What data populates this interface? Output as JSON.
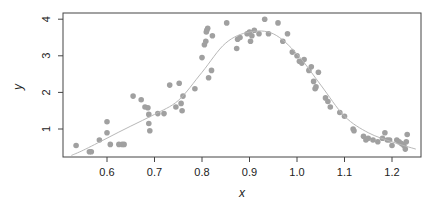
{
  "chart_data": {
    "type": "scatter",
    "title": "",
    "xlabel": "x",
    "ylabel": "y",
    "xlim": [
      0.52,
      1.26
    ],
    "ylim": [
      0.25,
      4.15
    ],
    "x_ticks": [
      0.6,
      0.7,
      0.8,
      0.9,
      1.0,
      1.1,
      1.2
    ],
    "x_tick_labels": [
      "0.6",
      "0.7",
      "0.8",
      "0.9",
      "1.0",
      "1.1",
      "1.2"
    ],
    "y_ticks": [
      1,
      2,
      3,
      4
    ],
    "y_tick_labels": [
      "1",
      "2",
      "3",
      "4"
    ],
    "grid": false,
    "legend": null,
    "point_color": "#a0a0a0",
    "curve_color": "#b8b8b8",
    "series": [
      {
        "name": "observations",
        "kind": "points",
        "x": [
          0.535,
          0.563,
          0.567,
          0.584,
          0.6,
          0.6,
          0.607,
          0.625,
          0.632,
          0.636,
          0.655,
          0.672,
          0.68,
          0.686,
          0.688,
          0.688,
          0.69,
          0.707,
          0.72,
          0.732,
          0.745,
          0.752,
          0.756,
          0.758,
          0.76,
          0.785,
          0.8,
          0.805,
          0.808,
          0.809,
          0.81,
          0.812,
          0.814,
          0.82,
          0.822,
          0.852,
          0.873,
          0.875,
          0.88,
          0.895,
          0.9,
          0.902,
          0.905,
          0.91,
          0.92,
          0.932,
          0.94,
          0.96,
          0.97,
          0.98,
          0.99,
          1.0,
          1.005,
          1.01,
          1.015,
          1.025,
          1.03,
          1.035,
          1.038,
          1.04,
          1.045,
          1.06,
          1.065,
          1.07,
          1.09,
          1.1,
          1.118,
          1.12,
          1.14,
          1.145,
          1.15,
          1.16,
          1.17,
          1.18,
          1.185,
          1.19,
          1.195,
          1.2,
          1.21,
          1.215,
          1.22,
          1.225,
          1.228,
          1.23,
          1.232
        ],
        "y": [
          0.55,
          0.38,
          0.38,
          0.7,
          0.9,
          1.2,
          0.58,
          0.58,
          0.58,
          0.58,
          1.9,
          1.8,
          1.6,
          1.58,
          1.4,
          1.15,
          0.95,
          1.42,
          1.42,
          2.2,
          1.6,
          2.25,
          1.7,
          1.5,
          1.9,
          2.1,
          2.95,
          3.3,
          3.4,
          3.65,
          3.7,
          3.75,
          2.4,
          2.6,
          3.55,
          3.9,
          3.2,
          3.45,
          3.5,
          3.6,
          3.65,
          3.4,
          3.55,
          3.7,
          3.6,
          4.0,
          3.6,
          3.9,
          3.4,
          3.6,
          3.1,
          3.0,
          2.85,
          2.8,
          2.9,
          2.6,
          2.7,
          2.3,
          2.1,
          2.15,
          2.55,
          1.85,
          1.75,
          1.6,
          1.45,
          1.35,
          1.0,
          0.95,
          0.8,
          0.7,
          0.75,
          0.7,
          0.65,
          0.75,
          0.9,
          0.7,
          0.7,
          0.55,
          0.7,
          0.65,
          0.6,
          0.55,
          0.45,
          0.65,
          0.85
        ]
      },
      {
        "name": "smooth fit",
        "kind": "line",
        "x": [
          0.525,
          0.55,
          0.6,
          0.65,
          0.7,
          0.75,
          0.8,
          0.85,
          0.9,
          0.95,
          1.0,
          1.05,
          1.1,
          1.15,
          1.2,
          1.25
        ],
        "y": [
          0.28,
          0.42,
          0.75,
          1.08,
          1.4,
          1.78,
          2.55,
          3.35,
          3.65,
          3.6,
          3.05,
          2.2,
          1.35,
          0.9,
          0.65,
          0.45
        ]
      }
    ]
  }
}
